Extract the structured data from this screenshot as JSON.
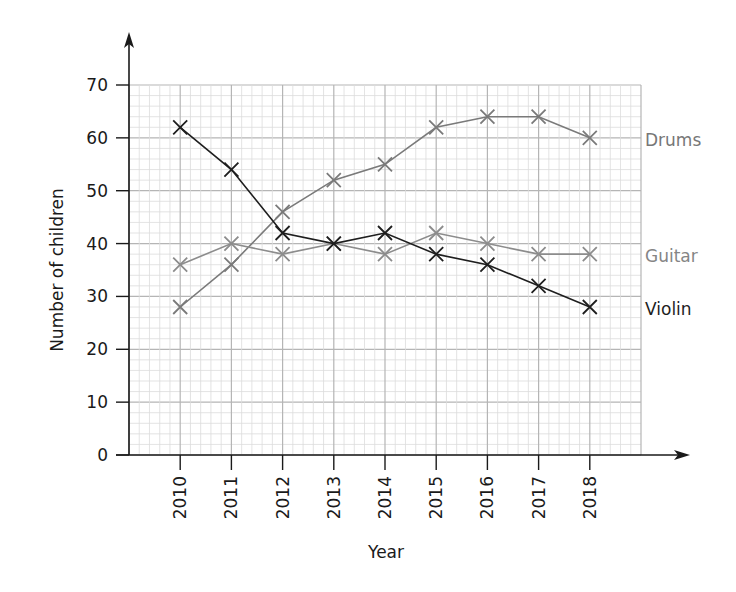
{
  "chart_data": {
    "type": "line",
    "title": "",
    "xlabel": "Year",
    "ylabel": "Number of children",
    "x": [
      "2010",
      "2011",
      "2012",
      "2013",
      "2014",
      "2015",
      "2016",
      "2017",
      "2018"
    ],
    "categories": [
      "2010",
      "2011",
      "2012",
      "2013",
      "2014",
      "2015",
      "2016",
      "2017",
      "2018"
    ],
    "yticks": [
      0,
      10,
      20,
      30,
      40,
      50,
      60,
      70
    ],
    "ylim": [
      0,
      70
    ],
    "grid": true,
    "grid_minor_y": 2,
    "grid_minor_x_per_year": 5,
    "marker": "x",
    "legend_position": "right (inline labels at line ends)",
    "series": [
      {
        "name": "Drums",
        "color": "#7a7a7a",
        "values": [
          28,
          36,
          46,
          52,
          55,
          62,
          64,
          64,
          60
        ]
      },
      {
        "name": "Guitar",
        "color": "#8c8c8c",
        "values": [
          36,
          40,
          38,
          40,
          38,
          42,
          40,
          38,
          38
        ]
      },
      {
        "name": "Violin",
        "color": "#1e1e1e",
        "values": [
          62,
          54,
          42,
          40,
          42,
          38,
          36,
          32,
          28
        ]
      }
    ]
  },
  "labels": {
    "ylabel": "Number of children",
    "xlabel": "Year",
    "drums": "Drums",
    "guitar": "Guitar",
    "violin": "Violin"
  },
  "colors": {
    "axis": "#1a1a1a",
    "grid_major": "#b5b5b5",
    "grid_minor": "#dcdcdc"
  }
}
